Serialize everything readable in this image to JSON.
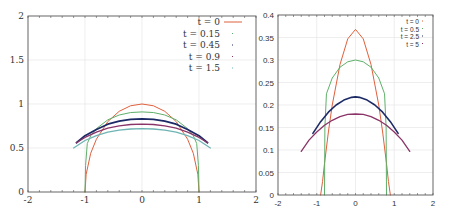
{
  "chart_data": [
    {
      "type": "line",
      "title": "",
      "xlabel": "",
      "ylabel": "",
      "xlim": [
        -2,
        2
      ],
      "ylim": [
        0,
        2
      ],
      "x_ticks": [
        "-2",
        "-1",
        "0",
        "1",
        "2"
      ],
      "y_ticks": [
        "0",
        "0.5",
        "1",
        "1.5",
        "2"
      ],
      "grid": true,
      "legend_position": "top-right",
      "series": [
        {
          "name": "t = 0",
          "color": "#e0603c",
          "width": 1.0,
          "x": [
            -1.0,
            -0.98,
            -0.9,
            -0.8,
            -0.6,
            -0.4,
            -0.2,
            0,
            0.2,
            0.4,
            0.6,
            0.8,
            0.9,
            0.98,
            1.0
          ],
          "y": [
            0.0,
            0.2,
            0.44,
            0.6,
            0.8,
            0.917,
            0.98,
            1.0,
            0.98,
            0.917,
            0.8,
            0.6,
            0.44,
            0.2,
            0.0
          ]
        },
        {
          "name": "t = 0.15",
          "color": "#5fb06a",
          "width": 1.0,
          "x": [
            -1.0,
            -0.99,
            -0.96,
            -0.9,
            -0.8,
            -0.6,
            -0.4,
            -0.2,
            0,
            0.2,
            0.4,
            0.6,
            0.8,
            0.9,
            0.96,
            0.99,
            1.0
          ],
          "y": [
            0.0,
            0.3,
            0.55,
            0.64,
            0.72,
            0.82,
            0.875,
            0.903,
            0.91,
            0.903,
            0.875,
            0.82,
            0.72,
            0.64,
            0.55,
            0.3,
            0.0
          ]
        },
        {
          "name": "t = 0.45",
          "color": "#1c2a66",
          "width": 1.8,
          "x": [
            -1.15,
            -1.0,
            -0.8,
            -0.6,
            -0.4,
            -0.2,
            0,
            0.2,
            0.4,
            0.6,
            0.8,
            1.0,
            1.15
          ],
          "y": [
            0.56,
            0.64,
            0.71,
            0.77,
            0.805,
            0.825,
            0.83,
            0.825,
            0.805,
            0.77,
            0.71,
            0.64,
            0.56
          ]
        },
        {
          "name": "t = 0.9",
          "color": "#8a3468",
          "width": 1.3,
          "x": [
            -1.15,
            -1.0,
            -0.8,
            -0.6,
            -0.4,
            -0.2,
            0,
            0.2,
            0.4,
            0.6,
            0.8,
            1.0,
            1.15
          ],
          "y": [
            0.56,
            0.62,
            0.68,
            0.725,
            0.752,
            0.767,
            0.772,
            0.767,
            0.752,
            0.725,
            0.68,
            0.62,
            0.56
          ]
        },
        {
          "name": "t = 1.5",
          "color": "#6fb4b4",
          "width": 1.3,
          "x": [
            -1.2,
            -1.0,
            -0.8,
            -0.6,
            -0.4,
            -0.2,
            0,
            0.2,
            0.4,
            0.6,
            0.8,
            1.0,
            1.2
          ],
          "y": [
            0.5,
            0.585,
            0.64,
            0.68,
            0.703,
            0.716,
            0.72,
            0.716,
            0.703,
            0.68,
            0.64,
            0.585,
            0.5
          ]
        }
      ]
    },
    {
      "type": "line",
      "title": "",
      "xlabel": "",
      "ylabel": "",
      "xlim": [
        -2,
        2
      ],
      "ylim": [
        0,
        0.4
      ],
      "x_ticks": [
        "-2",
        "-1",
        "0",
        "1",
        "2"
      ],
      "y_ticks": [
        "0",
        "0.05",
        "0.1",
        "0.15",
        "0.2",
        "0.25",
        "0.3",
        "0.35",
        "0.4"
      ],
      "grid": true,
      "legend_position": "top-right",
      "series": [
        {
          "name": "t = 0",
          "color": "#e0603c",
          "width": 1.0,
          "x": [
            -0.9,
            -0.85,
            -0.8,
            -0.7,
            -0.6,
            -0.4,
            -0.2,
            0,
            0.2,
            0.4,
            0.6,
            0.7,
            0.8,
            0.85,
            0.9
          ],
          "y": [
            0.0,
            0.03,
            0.07,
            0.14,
            0.2,
            0.29,
            0.347,
            0.368,
            0.347,
            0.29,
            0.2,
            0.14,
            0.07,
            0.03,
            0.0
          ]
        },
        {
          "name": "t = 0.5",
          "color": "#5fb06a",
          "width": 1.0,
          "x": [
            -0.8,
            -0.79,
            -0.75,
            -0.6,
            -0.4,
            -0.2,
            0,
            0.2,
            0.4,
            0.6,
            0.75,
            0.79,
            0.8
          ],
          "y": [
            0.0,
            0.15,
            0.225,
            0.26,
            0.284,
            0.296,
            0.3,
            0.296,
            0.284,
            0.26,
            0.225,
            0.15,
            0.0
          ]
        },
        {
          "name": "t = 2.5",
          "color": "#1c2a66",
          "width": 1.6,
          "x": [
            -1.1,
            -0.9,
            -0.7,
            -0.5,
            -0.3,
            -0.1,
            0,
            0.1,
            0.3,
            0.5,
            0.7,
            0.9,
            1.1
          ],
          "y": [
            0.137,
            0.163,
            0.184,
            0.2,
            0.211,
            0.217,
            0.218,
            0.217,
            0.211,
            0.2,
            0.184,
            0.163,
            0.137
          ]
        },
        {
          "name": "t = 5",
          "color": "#8a3468",
          "width": 1.3,
          "x": [
            -1.4,
            -1.2,
            -1.0,
            -0.8,
            -0.6,
            -0.4,
            -0.2,
            0,
            0.2,
            0.4,
            0.6,
            0.8,
            1.0,
            1.2,
            1.4
          ],
          "y": [
            0.097,
            0.122,
            0.14,
            0.155,
            0.166,
            0.174,
            0.179,
            0.18,
            0.179,
            0.174,
            0.166,
            0.155,
            0.14,
            0.122,
            0.097
          ]
        }
      ]
    }
  ]
}
